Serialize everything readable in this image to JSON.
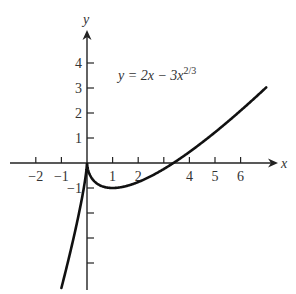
{
  "chart_data": {
    "type": "line",
    "title": "",
    "equation_label": "y = 2x − 3x^(2/3)",
    "equation_parts": {
      "lhs": "y = 2x − 3x",
      "exponent": "2/3"
    },
    "xlabel": "x",
    "ylabel": "y",
    "xlim": [
      -2.4,
      7.3
    ],
    "ylim": [
      -5,
      5.2
    ],
    "x_ticks": [
      -2,
      -1,
      1,
      2,
      3,
      4,
      5,
      6
    ],
    "x_tick_labels": [
      "−2",
      "−1",
      "1",
      "2",
      "4",
      "5",
      "6"
    ],
    "x_tick_labeled_values": [
      -2,
      -1,
      1,
      2,
      4,
      5,
      6
    ],
    "y_ticks": [
      -4,
      -3,
      -2,
      -1,
      1,
      2,
      3,
      4
    ],
    "y_tick_labels": [
      "1",
      "2",
      "3",
      "4",
      "−1"
    ],
    "y_tick_labeled_values": [
      1,
      2,
      3,
      4,
      -1
    ],
    "grid": false,
    "legend": null,
    "series": [
      {
        "name": "y = 2x − 3x^(2/3)",
        "x_range": [
          -1,
          7
        ],
        "color": "#111111",
        "key_points": [
          {
            "x": -1,
            "y": -5
          },
          {
            "x": 0,
            "y": 0,
            "note": "cusp"
          },
          {
            "x": 1,
            "y": -1,
            "note": "local minimum"
          },
          {
            "x": 3.375,
            "y": 0,
            "note": "x-intercept"
          },
          {
            "x": 7,
            "y": 3.02
          }
        ]
      }
    ]
  },
  "colors": {
    "curve": "#111111",
    "axes": "#222222",
    "text": "#333333"
  }
}
